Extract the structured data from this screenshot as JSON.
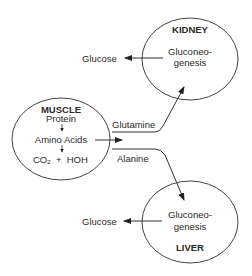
{
  "kidney": {
    "title": "KIDNEY",
    "process_line1": "Gluconeo-",
    "process_line2": "genesis",
    "output": "Glucose"
  },
  "liver": {
    "title": "LIVER",
    "process_line1": "Gluconeo-",
    "process_line2": "genesis",
    "output": "Glucose"
  },
  "muscle": {
    "title": "MUSCLE",
    "step1": "Protein",
    "step2": "Amino Acids",
    "co2_base": "CO",
    "co2_sub": "2",
    "plus": "+",
    "water": "HOH"
  },
  "arrows": {
    "to_kidney": "Glutamine",
    "to_liver": "Alanine"
  },
  "colors": {
    "line": "#333333",
    "text": "#2a2a2a"
  }
}
